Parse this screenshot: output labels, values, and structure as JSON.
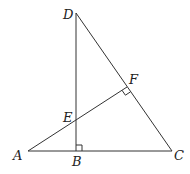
{
  "diagram": {
    "title": "",
    "points": {
      "A": {
        "label": "A",
        "x": 28,
        "y": 151
      },
      "B": {
        "label": "B",
        "x": 76,
        "y": 151
      },
      "C": {
        "label": "C",
        "x": 172,
        "y": 151
      },
      "D": {
        "label": "D",
        "x": 76,
        "y": 13
      },
      "E": {
        "label": "E",
        "x": 76,
        "y": 120
      },
      "F": {
        "label": "F",
        "x": 127,
        "y": 87
      }
    },
    "segments": [
      "AC",
      "DB",
      "DC",
      "AF"
    ],
    "right_angles": [
      "B",
      "F"
    ],
    "stroke_color": "#333333"
  }
}
